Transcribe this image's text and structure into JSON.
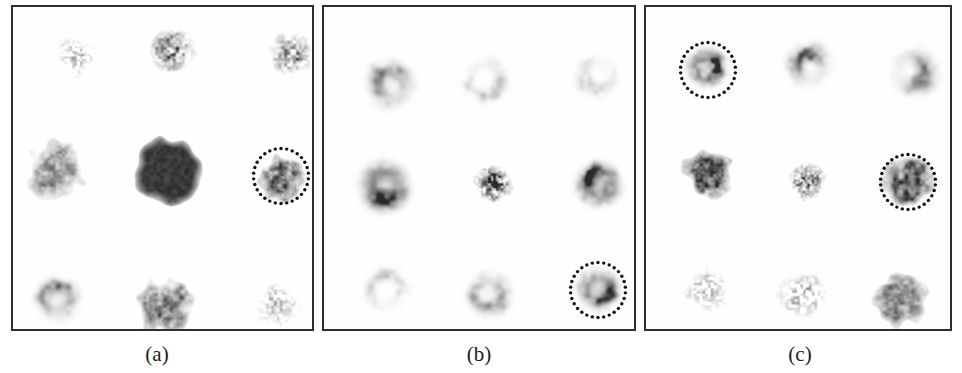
{
  "figure": {
    "background_color": "#ffffff",
    "panel_border_color": "#2e2e30",
    "panel_background": "#fefefe",
    "marker_color": "#101013",
    "caption_color": "#1b1b1d"
  },
  "panels": [
    {
      "id": "panel-a",
      "caption": "(a)",
      "caption_x": 157,
      "caption_y": 341,
      "box": {
        "x": 11,
        "y": 5,
        "w": 303,
        "h": 326
      },
      "grid": {
        "columns_x": [
          62,
          160,
          277
        ],
        "rows_y": [
          45,
          165,
          294
        ]
      },
      "spots": [
        {
          "row": 0,
          "col": 0,
          "cx": 60,
          "cy": 45,
          "radius": 22,
          "darkness": 0.38,
          "style": "speckle-sparse",
          "seed": 11
        },
        {
          "row": 0,
          "col": 1,
          "cx": 158,
          "cy": 44,
          "radius": 26,
          "darkness": 0.72,
          "style": "speckle-dense",
          "seed": 12
        },
        {
          "row": 0,
          "col": 2,
          "cx": 281,
          "cy": 46,
          "radius": 25,
          "darkness": 0.62,
          "style": "speckle-dense",
          "seed": 13
        },
        {
          "row": 1,
          "col": 0,
          "cx": 44,
          "cy": 160,
          "radius": 26,
          "darkness": 0.6,
          "style": "blob-ragged",
          "seed": 14
        },
        {
          "row": 1,
          "col": 1,
          "cx": 152,
          "cy": 163,
          "radius": 30,
          "darkness": 1.0,
          "style": "solid-blob",
          "seed": 15
        },
        {
          "row": 1,
          "col": 2,
          "cx": 267,
          "cy": 170,
          "radius": 21,
          "darkness": 0.78,
          "style": "blob-ragged",
          "seed": 16
        },
        {
          "row": 2,
          "col": 0,
          "cx": 45,
          "cy": 295,
          "radius": 25,
          "darkness": 0.5,
          "style": "ring-open",
          "seed": 17
        },
        {
          "row": 2,
          "col": 1,
          "cx": 152,
          "cy": 296,
          "radius": 26,
          "darkness": 0.7,
          "style": "blob-ragged",
          "seed": 18
        },
        {
          "row": 2,
          "col": 2,
          "cx": 262,
          "cy": 297,
          "radius": 24,
          "darkness": 0.34,
          "style": "speckle-sparse",
          "seed": 19
        }
      ],
      "markers": [
        {
          "cx": 268,
          "cy": 169,
          "diameter": 55,
          "dots": 30,
          "dot_size": 3.4
        }
      ]
    },
    {
      "id": "panel-b",
      "caption": "(b)",
      "caption_x": 479,
      "caption_y": 341,
      "box": {
        "x": 322,
        "y": 5,
        "w": 314,
        "h": 326
      },
      "grid": {
        "columns_x": [
          64,
          166,
          276
        ],
        "rows_y": [
          73,
          177,
          283
        ]
      },
      "spots": [
        {
          "row": 0,
          "col": 0,
          "cx": 64,
          "cy": 74,
          "radius": 27,
          "darkness": 0.48,
          "style": "ring-open",
          "seed": 21
        },
        {
          "row": 0,
          "col": 1,
          "cx": 164,
          "cy": 72,
          "radius": 26,
          "darkness": 0.3,
          "style": "ring-faint",
          "seed": 22
        },
        {
          "row": 0,
          "col": 2,
          "cx": 272,
          "cy": 70,
          "radius": 25,
          "darkness": 0.24,
          "style": "ring-faint",
          "seed": 23
        },
        {
          "row": 1,
          "col": 0,
          "cx": 62,
          "cy": 177,
          "radius": 29,
          "darkness": 0.82,
          "style": "ring-thick",
          "seed": 24
        },
        {
          "row": 1,
          "col": 1,
          "cx": 165,
          "cy": 177,
          "radius": 22,
          "darkness": 0.86,
          "style": "speckle-dense",
          "seed": 25
        },
        {
          "row": 1,
          "col": 2,
          "cx": 275,
          "cy": 176,
          "radius": 25,
          "darkness": 0.88,
          "style": "ring-thick",
          "seed": 26
        },
        {
          "row": 2,
          "col": 0,
          "cx": 62,
          "cy": 285,
          "radius": 26,
          "darkness": 0.28,
          "style": "ring-faint",
          "seed": 27
        },
        {
          "row": 2,
          "col": 1,
          "cx": 164,
          "cy": 284,
          "radius": 25,
          "darkness": 0.42,
          "style": "ring-open",
          "seed": 28
        },
        {
          "row": 2,
          "col": 2,
          "cx": 274,
          "cy": 283,
          "radius": 24,
          "darkness": 0.74,
          "style": "ring-thick",
          "seed": 29
        }
      ],
      "markers": [
        {
          "cx": 274,
          "cy": 283,
          "diameter": 55,
          "dots": 30,
          "dot_size": 3.4
        }
      ]
    },
    {
      "id": "panel-c",
      "caption": "(c)",
      "caption_x": 800,
      "caption_y": 341,
      "box": {
        "x": 644,
        "y": 5,
        "w": 308,
        "h": 326
      },
      "grid": {
        "columns_x": [
          62,
          162,
          265
        ],
        "rows_y": [
          63,
          172,
          288
        ]
      },
      "spots": [
        {
          "row": 0,
          "col": 0,
          "cx": 62,
          "cy": 63,
          "radius": 22,
          "darkness": 0.84,
          "style": "ring-thick",
          "seed": 31
        },
        {
          "row": 0,
          "col": 1,
          "cx": 164,
          "cy": 62,
          "radius": 24,
          "darkness": 0.66,
          "style": "crescent",
          "seed": 32
        },
        {
          "row": 0,
          "col": 2,
          "cx": 267,
          "cy": 65,
          "radius": 25,
          "darkness": 0.58,
          "style": "crescent",
          "seed": 33
        },
        {
          "row": 1,
          "col": 0,
          "cx": 60,
          "cy": 168,
          "radius": 23,
          "darkness": 0.84,
          "style": "blob-ragged",
          "seed": 34
        },
        {
          "row": 1,
          "col": 1,
          "cx": 162,
          "cy": 173,
          "radius": 20,
          "darkness": 0.7,
          "style": "speckle-dense",
          "seed": 35
        },
        {
          "row": 1,
          "col": 2,
          "cx": 260,
          "cy": 175,
          "radius": 25,
          "darkness": 0.8,
          "style": "blob-ragged",
          "seed": 36
        },
        {
          "row": 2,
          "col": 0,
          "cx": 60,
          "cy": 282,
          "radius": 24,
          "darkness": 0.4,
          "style": "speckle-sparse",
          "seed": 37
        },
        {
          "row": 2,
          "col": 1,
          "cx": 158,
          "cy": 287,
          "radius": 25,
          "darkness": 0.46,
          "style": "speckle-sparse",
          "seed": 38
        },
        {
          "row": 2,
          "col": 2,
          "cx": 255,
          "cy": 290,
          "radius": 25,
          "darkness": 0.62,
          "style": "blob-ragged",
          "seed": 39
        }
      ],
      "markers": [
        {
          "cx": 62,
          "cy": 63,
          "diameter": 55,
          "dots": 30,
          "dot_size": 3.4
        },
        {
          "cx": 262,
          "cy": 175,
          "diameter": 55,
          "dots": 30,
          "dot_size": 3.4
        }
      ]
    }
  ]
}
